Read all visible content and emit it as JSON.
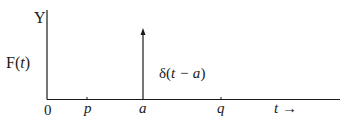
{
  "diagram": {
    "y_axis_label": "Y",
    "function_label_prefix": "F(",
    "function_label_var": "t",
    "function_label_suffix": ")",
    "impulse_label_prefix": "δ(",
    "impulse_label_inner": "t − a",
    "impulse_label_suffix": ")",
    "ticks": [
      {
        "label": "0",
        "italic": false
      },
      {
        "label": "p",
        "italic": true
      },
      {
        "label": "a",
        "italic": true
      },
      {
        "label": "q",
        "italic": true
      }
    ],
    "t_axis_label": "t",
    "t_axis_arrow": "→",
    "colors": {
      "line": "#1a1a1a",
      "background": "#ffffff"
    }
  }
}
